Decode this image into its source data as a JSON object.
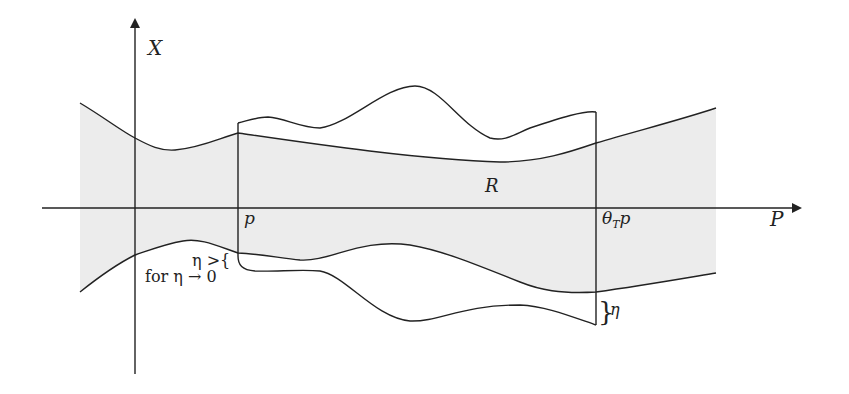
{
  "diagram": {
    "axes": {
      "vertical_label": "X",
      "horizontal_label": "P"
    },
    "region_label": "R",
    "markers": {
      "left_line_label": "p",
      "right_line_label_main": "θ",
      "right_line_label_sub": "T",
      "right_line_label_tail": "p"
    },
    "annotations": {
      "eta_gap_left": "η >{",
      "eta_limit": "for η → 0",
      "eta_gap_right_brace": "}",
      "eta_gap_right": "η"
    },
    "colors": {
      "line": "#222222",
      "shade": "#ececec",
      "background": "#ffffff"
    }
  }
}
